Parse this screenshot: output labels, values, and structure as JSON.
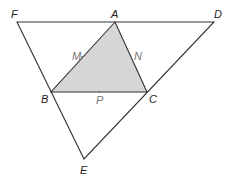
{
  "diagram": {
    "colors": {
      "line": "#333333",
      "fill": "#d6d6d6",
      "main_label": "#222222",
      "mid_label": "#777777"
    },
    "points": {
      "F": {
        "label": "F",
        "x": 17,
        "y": 22
      },
      "A": {
        "label": "A",
        "x": 115,
        "y": 22
      },
      "D": {
        "label": "D",
        "x": 214,
        "y": 22
      },
      "B": {
        "label": "B",
        "x": 51,
        "y": 92
      },
      "C": {
        "label": "C",
        "x": 147,
        "y": 92
      },
      "E": {
        "label": "E",
        "x": 84,
        "y": 159
      },
      "M": {
        "label": "M",
        "x": 82,
        "y": 57
      },
      "N": {
        "label": "N",
        "x": 131,
        "y": 57
      },
      "P": {
        "label": "P",
        "x": 99,
        "y": 92
      }
    },
    "outer_triangle": [
      "F",
      "D",
      "E"
    ],
    "shaded_triangle": [
      "A",
      "B",
      "C"
    ]
  }
}
